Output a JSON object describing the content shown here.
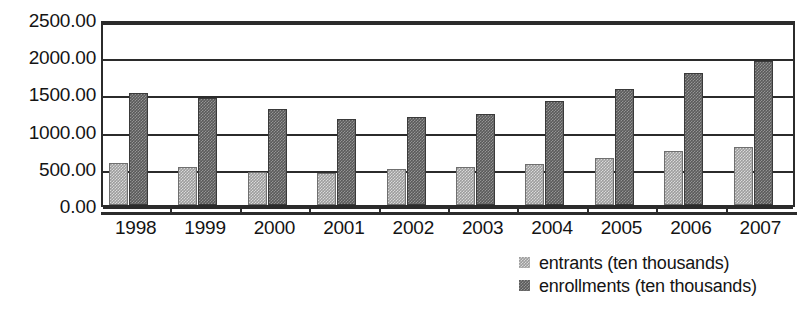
{
  "chart_data": {
    "type": "bar",
    "title": "",
    "subtitle": "",
    "xlabel": "",
    "ylabel": "",
    "categories": [
      "1998",
      "1999",
      "2000",
      "2001",
      "2002",
      "2003",
      "2004",
      "2005",
      "2006",
      "2007"
    ],
    "series": [
      {
        "name": "entrants (ten thousands)",
        "color": "#9d9d9d",
        "values": [
          565,
          515,
          440,
          435,
          490,
          505,
          555,
          630,
          725,
          780
        ]
      },
      {
        "name": "enrollments (ten thousands)",
        "color": "#5a5a5a",
        "values": [
          1510,
          1440,
          1290,
          1160,
          1180,
          1230,
          1400,
          1560,
          1780,
          1930
        ]
      }
    ],
    "ylim": [
      0,
      2500
    ],
    "ytick_values": [
      0,
      500,
      1000,
      1500,
      2000,
      2500
    ],
    "ytick_labels": [
      "0.00",
      "500.00",
      "1000.00",
      "1500.00",
      "2000.00",
      "2500.00"
    ],
    "grid": true,
    "grid_axis": "y",
    "legend_position": "bottom-right",
    "legend": [
      {
        "label": "entrants (ten thousands)",
        "swatch": "entrants"
      },
      {
        "label": "enrollments (ten thousands)",
        "swatch": "enrollments"
      }
    ]
  }
}
